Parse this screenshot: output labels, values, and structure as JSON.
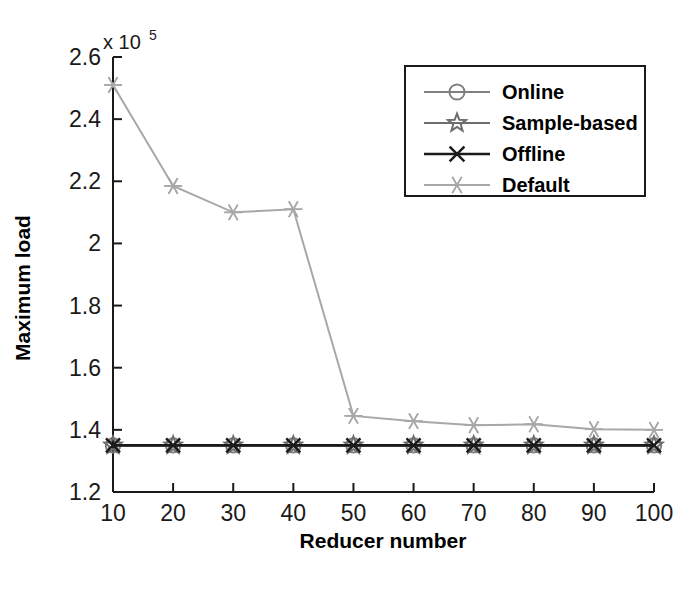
{
  "chart_data": {
    "type": "line",
    "title": "",
    "xlabel": "Reducer number",
    "ylabel": "Maximum load",
    "y_exponent_label": "x 10",
    "y_exponent_power": "5",
    "xlim": [
      10,
      100
    ],
    "ylim": [
      1.2,
      2.6
    ],
    "x": [
      10,
      20,
      30,
      40,
      50,
      60,
      70,
      80,
      90,
      100
    ],
    "xticks": [
      "10",
      "20",
      "30",
      "40",
      "50",
      "60",
      "70",
      "80",
      "90",
      "100"
    ],
    "yticks": [
      "1.2",
      "1.4",
      "1.6",
      "1.8",
      "2",
      "2.2",
      "2.4",
      "2.6"
    ],
    "grid": false,
    "legend_position": "upper right",
    "series": [
      {
        "name": "Online",
        "marker": "circle",
        "color": "#808080",
        "values": [
          1.35,
          1.35,
          1.35,
          1.35,
          1.35,
          1.35,
          1.35,
          1.35,
          1.35,
          1.35
        ]
      },
      {
        "name": "Sample-based",
        "marker": "pentagram",
        "color": "#6e6e6e",
        "values": [
          1.35,
          1.35,
          1.35,
          1.35,
          1.35,
          1.35,
          1.35,
          1.35,
          1.35,
          1.35
        ]
      },
      {
        "name": "Offline",
        "marker": "x",
        "color": "#1a1a1a",
        "values": [
          1.35,
          1.35,
          1.35,
          1.35,
          1.35,
          1.35,
          1.35,
          1.35,
          1.35,
          1.35
        ]
      },
      {
        "name": "Default",
        "marker": "asterisk",
        "color": "#a8a8a8",
        "values": [
          2.51,
          2.185,
          2.1,
          2.11,
          1.445,
          1.428,
          1.415,
          1.418,
          1.402,
          1.4
        ]
      }
    ]
  },
  "legend": {
    "entries": [
      {
        "label": "Online"
      },
      {
        "label": "Sample-based"
      },
      {
        "label": "Offline"
      },
      {
        "label": "Default"
      }
    ]
  }
}
